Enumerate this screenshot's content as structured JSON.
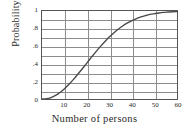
{
  "chart_data": {
    "type": "line",
    "title": "",
    "xlabel": "Number of persons",
    "ylabel": "Probability",
    "xlim": [
      0,
      60
    ],
    "ylim": [
      0,
      1
    ],
    "grid": true,
    "legend": false,
    "xticks": [
      10,
      20,
      30,
      40,
      50,
      60
    ],
    "xtick_labels": [
      "10",
      "20",
      "30",
      "40",
      "50",
      "60"
    ],
    "yticks": [
      0,
      0.2,
      0.4,
      0.6,
      0.8,
      1
    ],
    "ytick_labels": [
      "0",
      ".2",
      ".4",
      ".6",
      ".8",
      "1"
    ],
    "x_gridlines": [
      10,
      20,
      30,
      40,
      50
    ],
    "y_gridlines": [
      0.1,
      0.2,
      0.3,
      0.4,
      0.5,
      0.6,
      0.7,
      0.8,
      0.9
    ],
    "series": [
      {
        "name": "Probability of shared birthday",
        "color": "#4a4a4a",
        "x": [
          0,
          2,
          4,
          6,
          8,
          10,
          12,
          14,
          16,
          18,
          20,
          22,
          23,
          24,
          26,
          28,
          30,
          32,
          34,
          36,
          38,
          40,
          42,
          44,
          46,
          48,
          50,
          52,
          54,
          56,
          58,
          60
        ],
        "y": [
          0.0,
          0.003,
          0.016,
          0.04,
          0.074,
          0.117,
          0.167,
          0.223,
          0.284,
          0.347,
          0.411,
          0.476,
          0.507,
          0.538,
          0.598,
          0.654,
          0.706,
          0.753,
          0.795,
          0.832,
          0.864,
          0.891,
          0.914,
          0.933,
          0.948,
          0.961,
          0.97,
          0.978,
          0.984,
          0.988,
          0.992,
          0.994
        ]
      }
    ]
  },
  "style": {
    "grid_color": "#8c8c8c",
    "frame_color": "#555555",
    "curve_color": "#4a4a4a",
    "text_color": "#2a2a2a",
    "background": "#ffffff"
  }
}
